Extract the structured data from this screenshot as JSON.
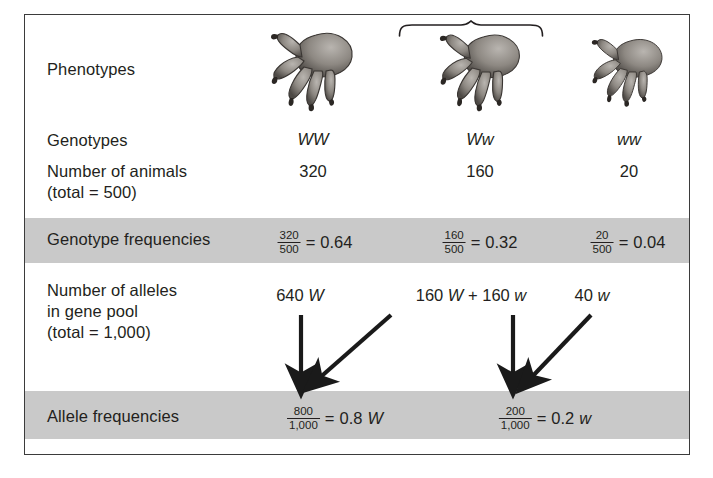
{
  "figure": {
    "border_color": "#3b3b3b",
    "band_color": "#c9c9c9",
    "text_color": "#231f20"
  },
  "rows": {
    "phenotypes_label": "Phenotypes",
    "genotypes_label": "Genotypes",
    "number_of_animals_label": "Number of animals",
    "number_of_animals_total": "(total = 500)",
    "genotype_frequencies_label": "Genotype frequencies",
    "number_of_alleles_label_line1": "Number of alleles",
    "number_of_alleles_label_line2": "in gene pool",
    "number_of_alleles_total": "(total = 1,000)",
    "allele_frequencies_label": "Allele frequencies"
  },
  "columns": [
    {
      "genotype": "WW",
      "phenotype_icon": "clawed-paw-icon",
      "count": "320",
      "frequency": {
        "numerator": "320",
        "denominator": "500",
        "equals": "=",
        "result": "0.64"
      }
    },
    {
      "genotype": "Ww",
      "phenotype_icon": "clawed-paw-icon",
      "count": "160",
      "frequency": {
        "numerator": "160",
        "denominator": "500",
        "equals": "=",
        "result": "0.32"
      }
    },
    {
      "genotype": "ww",
      "phenotype_icon": "clawed-paw-icon",
      "count": "20",
      "frequency": {
        "numerator": "20",
        "denominator": "500",
        "equals": "=",
        "result": "0.04"
      }
    }
  ],
  "gene_pool": {
    "homozygous_dominant": {
      "count": "640",
      "allele": "W"
    },
    "heterozygous": {
      "left_count": "160",
      "left_allele": "W",
      "plus": "+",
      "right_count": "160",
      "right_allele": "w"
    },
    "homozygous_recessive": {
      "count": "40",
      "allele": "w"
    }
  },
  "allele_frequencies": [
    {
      "numerator": "800",
      "denominator": "1,000",
      "equals": "=",
      "result": "0.8",
      "allele": "W"
    },
    {
      "numerator": "200",
      "denominator": "1,000",
      "equals": "=",
      "result": "0.2",
      "allele": "w"
    }
  ]
}
